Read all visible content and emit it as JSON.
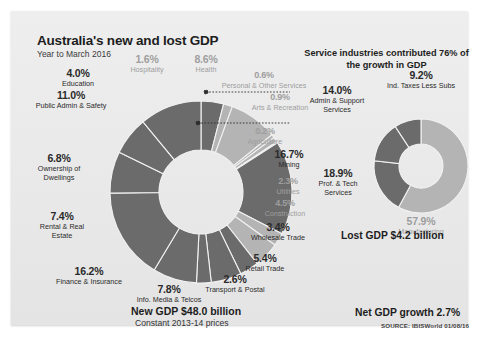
{
  "header": {
    "title": "Australia's new and lost GDP",
    "subtitle": "Year to March 2016",
    "service_note": "Service industries contributed 76% of the growth in GDP"
  },
  "footer": {
    "new_gdp": "New GDP $48.0 billion",
    "new_gdp_sub": "Constant 2013-14 prices",
    "lost_gdp": "Lost GDP $4.2 billion",
    "net_gdp": "Net GDP growth 2.7%",
    "source": "SOURCE: IBISWorld 01/08/16"
  },
  "colors": {
    "dark": "#6b6b6b",
    "light": "#b4b4b4",
    "card": "#ebebeb",
    "label_dark": "#2a2a2a",
    "label_light": "#9e9e9e"
  },
  "chart_data": [
    {
      "type": "pie",
      "name": "new-gdp-donut",
      "title": "New GDP $48.0 billion",
      "unit": "%",
      "categories": [
        "Education",
        "Hospitality",
        "Health",
        "Personal & Other Services",
        "Arts & Recreation",
        "Agriculture",
        "Mining",
        "Utilities",
        "Construction",
        "Wholesale Trade",
        "Retail Trade",
        "Transport & Postal",
        "Info. Media & Telcos",
        "Finance & Insurance",
        "Rental & Real Estate",
        "Ownership of Dwellings",
        "Public Admin & Safety"
      ],
      "values": [
        4.0,
        1.6,
        8.6,
        0.6,
        0.9,
        0.2,
        16.7,
        2.3,
        4.5,
        3.4,
        5.4,
        2.6,
        7.8,
        16.2,
        7.4,
        6.8,
        11.0
      ],
      "labels": [
        {
          "pct": "4.0%",
          "name": "Education",
          "tone": "dark"
        },
        {
          "pct": "1.6%",
          "name": "Hospitality",
          "tone": "light"
        },
        {
          "pct": "8.6%",
          "name": "Health",
          "tone": "light"
        },
        {
          "pct": "0.6%",
          "name": "Personal & Other Services",
          "tone": "light"
        },
        {
          "pct": "0.9%",
          "name": "Arts & Recreation",
          "tone": "light"
        },
        {
          "pct": "0.2%",
          "name": "Agriculture",
          "tone": "light"
        },
        {
          "pct": "16.7%",
          "name": "Mining",
          "tone": "dark"
        },
        {
          "pct": "2.3%",
          "name": "Utilities",
          "tone": "light"
        },
        {
          "pct": "4.5%",
          "name": "Construction",
          "tone": "light"
        },
        {
          "pct": "3.4%",
          "name": "Wholesale Trade",
          "tone": "dark"
        },
        {
          "pct": "5.4%",
          "name": "Retail Trade",
          "tone": "dark"
        },
        {
          "pct": "2.6%",
          "name": "Transport & Postal",
          "tone": "dark"
        },
        {
          "pct": "7.8%",
          "name": "Info. Media & Telcos",
          "tone": "dark"
        },
        {
          "pct": "16.2%",
          "name": "Finance & Insurance",
          "tone": "dark"
        },
        {
          "pct": "7.4%",
          "name": "Rental & Real Estate",
          "tone": "dark"
        },
        {
          "pct": "6.8%",
          "name": "Ownership of Dwellings",
          "tone": "dark"
        },
        {
          "pct": "11.0%",
          "name": "Public Admin & Safety",
          "tone": "dark"
        }
      ]
    },
    {
      "type": "pie",
      "name": "lost-gdp-donut",
      "title": "Lost GDP $4.2 billion",
      "unit": "%",
      "categories": [
        "Manufacturing",
        "Prof. & Tech Services",
        "Admin & Support Services",
        "Ind. Taxes Less Subs"
      ],
      "values": [
        57.9,
        18.9,
        14.0,
        9.2
      ],
      "labels": [
        {
          "pct": "57.9%",
          "name": "Manufacturing",
          "tone": "light"
        },
        {
          "pct": "18.9%",
          "name": "Prof. & Tech Services",
          "tone": "dark"
        },
        {
          "pct": "14.0%",
          "name": "Admin & Support Services",
          "tone": "dark"
        },
        {
          "pct": "9.2%",
          "name": "Ind. Taxes Less Subs",
          "tone": "dark"
        }
      ]
    }
  ]
}
